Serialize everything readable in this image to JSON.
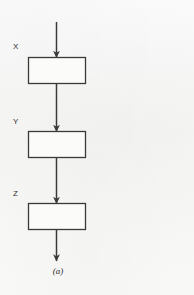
{
  "figure": {
    "caption": "(a)",
    "kind": "flow-diagram",
    "background_color": "#f7f7f6",
    "stroke_color": "#3a3a3a"
  },
  "nodes": [
    {
      "id": "x",
      "label": "X",
      "shape": "rectangle",
      "x": 28,
      "y": 57,
      "width": 57,
      "height": 26
    },
    {
      "id": "y",
      "label": "Y",
      "shape": "rectangle",
      "x": 28,
      "y": 131,
      "width": 57,
      "height": 26
    },
    {
      "id": "z",
      "label": "Z",
      "shape": "rectangle",
      "x": 28,
      "y": 203,
      "width": 57,
      "height": 26
    }
  ],
  "connectors": [
    {
      "id": "input-arrow",
      "from": "input",
      "to": "x",
      "direction": "down"
    },
    {
      "id": "x-to-y-arrow",
      "from": "x",
      "to": "y",
      "direction": "down"
    },
    {
      "id": "y-to-z-arrow",
      "from": "y",
      "to": "z",
      "direction": "down"
    },
    {
      "id": "output-arrow",
      "from": "z",
      "to": "output",
      "direction": "down"
    }
  ]
}
